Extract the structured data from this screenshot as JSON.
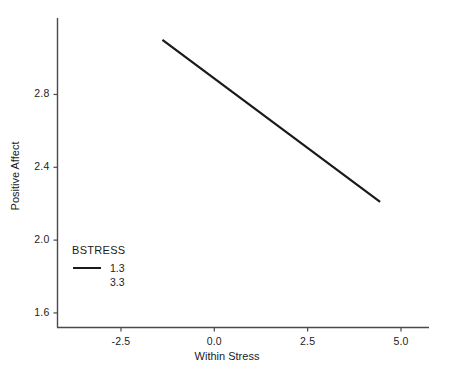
{
  "chart_data": {
    "type": "line",
    "title": "",
    "subtitle": "",
    "xlabel": "Within Stress",
    "ylabel": "Positive Affect",
    "xlim": [
      -4.2,
      5.75
    ],
    "ylim": [
      1.52,
      3.22
    ],
    "xticks": [
      -2.5,
      0.0,
      2.5,
      5.0
    ],
    "xticklabels": [
      "-2.5",
      "0.0",
      "2.5",
      "5.0"
    ],
    "yticks": [
      1.6,
      2.0,
      2.4,
      2.8
    ],
    "yticklabels": [
      "1.6",
      "2.0",
      "2.4",
      "2.8"
    ],
    "grid": false,
    "legend": {
      "title": "BSTRESS",
      "position": "inside-lower-left",
      "entries": [
        {
          "label": "1.3",
          "color": "#1a1a1a",
          "visible_swatch": true
        },
        {
          "label": "3.3",
          "color": "#ffffff",
          "visible_swatch": false
        }
      ]
    },
    "series": [
      {
        "name": "1.3",
        "color": "#1a1a1a",
        "linewidth": 2.2,
        "x": [
          -1.39,
          4.44
        ],
        "y": [
          3.1,
          2.21
        ]
      },
      {
        "name": "3.3",
        "color": "#ffffff",
        "linewidth": 2.2,
        "x": [
          -1.39,
          4.44
        ],
        "y": [
          2.62,
          2.05
        ]
      }
    ]
  },
  "axes": {
    "x_axis_name": "x-axis",
    "y_axis_name": "y-axis"
  }
}
